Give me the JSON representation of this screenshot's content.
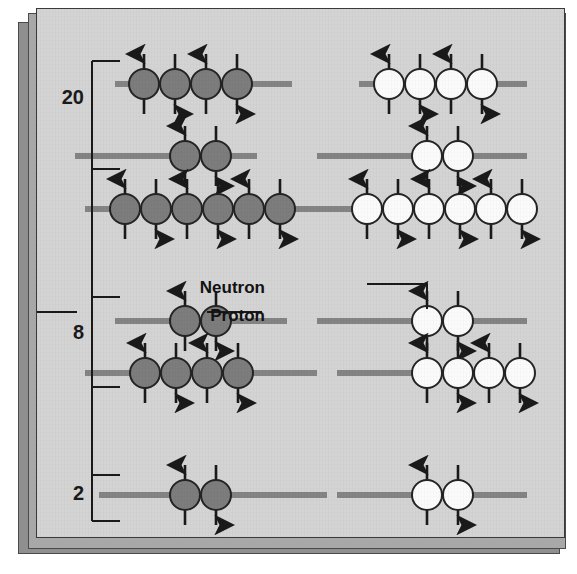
{
  "figure": {
    "background_color": "#d4d4d4",
    "proton_color": "#7d7d7d",
    "neutron_color": "#fbfbfb",
    "line_color": "#848484",
    "ink_color": "#1a1a1a"
  },
  "labels": {
    "neutron": "Neutron",
    "proton": "Proton"
  },
  "magic_numbers": [
    {
      "value": "20",
      "y_top": 52,
      "y_bottom": 160,
      "text_y": 90
    },
    {
      "value": "8",
      "y_top": 288,
      "y_bottom": 378,
      "text_y": 325
    },
    {
      "value": "2",
      "y_top": 466,
      "y_bottom": 512,
      "text_y": 486
    }
  ],
  "spine": {
    "x": 55,
    "y_top": 52,
    "y_bottom": 512
  },
  "levels": [
    {
      "name": "level-20-a",
      "y": 75,
      "proton_line": {
        "x1": 78,
        "x2": 255
      },
      "neutron_line": {
        "x1": 322,
        "x2": 490
      },
      "protons": {
        "start_x": 107,
        "count": 4,
        "spins": [
          "up",
          "down",
          "up",
          "down"
        ]
      },
      "neutrons": {
        "start_x": 352,
        "count": 4,
        "spins": [
          "up",
          "down",
          "up",
          "down"
        ]
      }
    },
    {
      "name": "level-20-b",
      "y": 147,
      "proton_line": {
        "x1": 38,
        "x2": 220
      },
      "neutron_line": {
        "x1": 280,
        "x2": 490
      },
      "protons": {
        "start_x": 148,
        "count": 2,
        "spins": [
          "up",
          "down"
        ]
      },
      "neutrons": {
        "start_x": 390,
        "count": 2,
        "spins": [
          "up",
          "down"
        ]
      }
    },
    {
      "name": "level-20-c",
      "y": 200,
      "proton_line": {
        "x1": 48,
        "x2": 290
      },
      "neutron_line": {
        "x1": 290,
        "x2": 490
      },
      "protons": {
        "start_x": 88,
        "count": 6,
        "spins": [
          "up",
          "down",
          "up",
          "down",
          "up",
          "down"
        ]
      },
      "neutrons": {
        "start_x": 330,
        "count": 6,
        "spins": [
          "up",
          "down",
          "up",
          "down",
          "up",
          "down"
        ]
      }
    },
    {
      "name": "level-8-a",
      "y": 312,
      "proton_line": {
        "x1": 78,
        "x2": 250
      },
      "neutron_line": {
        "x1": 280,
        "x2": 490
      },
      "protons": {
        "start_x": 148,
        "count": 2,
        "spins": [
          "up",
          "down"
        ]
      },
      "neutrons": {
        "start_x": 390,
        "count": 2,
        "spins": [
          "up",
          "down"
        ]
      }
    },
    {
      "name": "level-8-b",
      "y": 364,
      "proton_line": {
        "x1": 48,
        "x2": 280
      },
      "neutron_line": {
        "x1": 300,
        "x2": 490
      },
      "protons": {
        "start_x": 108,
        "count": 4,
        "spins": [
          "up",
          "down",
          "up",
          "down"
        ]
      },
      "neutrons": {
        "start_x": 390,
        "count": 4,
        "spins": [
          "up",
          "down",
          "up",
          "down"
        ]
      }
    },
    {
      "name": "level-2",
      "y": 486,
      "proton_line": {
        "x1": 62,
        "x2": 290
      },
      "neutron_line": {
        "x1": 300,
        "x2": 490
      },
      "protons": {
        "start_x": 148,
        "count": 2,
        "spins": [
          "up",
          "down"
        ]
      },
      "neutrons": {
        "start_x": 390,
        "count": 2,
        "spins": [
          "up",
          "down"
        ]
      }
    }
  ],
  "leaders": {
    "neutron": {
      "text_x": 228,
      "text_y": 280,
      "path": "M 330 275 L 390 275 L 390 300"
    },
    "proton": {
      "text_x": 228,
      "text_y": 308,
      "path": "M 225 303 L 170 303"
    },
    "proton_left_stub": {
      "x1": 0,
      "x2": 40,
      "y": 303
    }
  },
  "geometry": {
    "radius": 15,
    "spacing": 31,
    "arrow_len": 30,
    "line_thickness": 6
  }
}
